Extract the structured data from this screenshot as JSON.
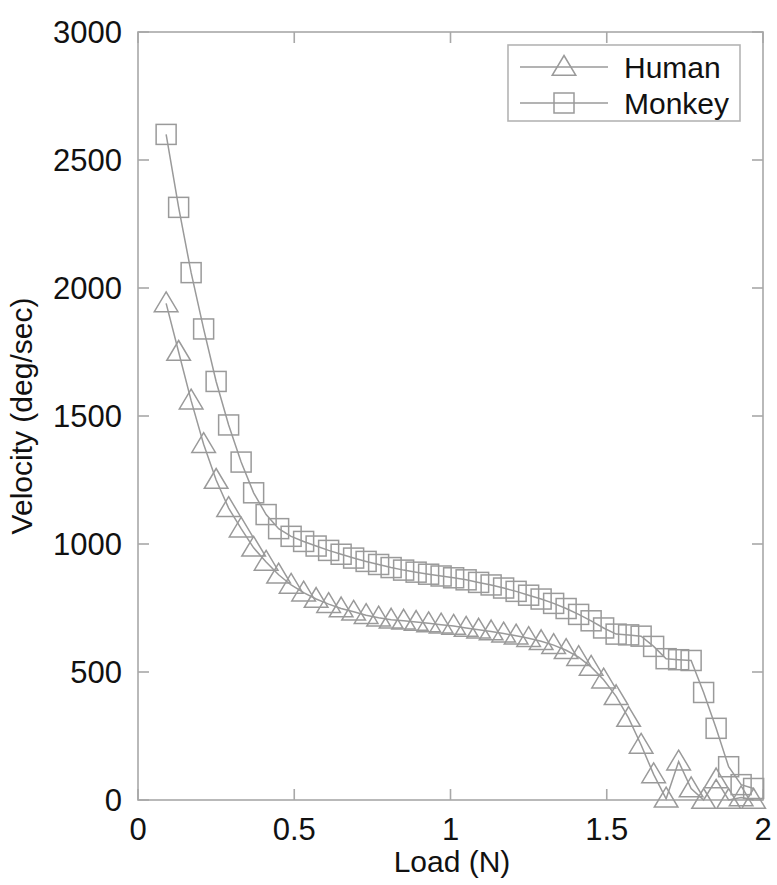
{
  "chart_data": {
    "type": "line",
    "title": "",
    "xlabel": "Load (N)",
    "ylabel": "Velocity (deg/sec)",
    "xlim": [
      0,
      2
    ],
    "ylim": [
      0,
      3000
    ],
    "xticks": [
      "0",
      "0.5",
      "1",
      "1.5",
      "2"
    ],
    "xtick_values": [
      0,
      0.5,
      1,
      1.5,
      2
    ],
    "yticks": [
      "0",
      "500",
      "1000",
      "1500",
      "2000",
      "2500",
      "3000"
    ],
    "ytick_values": [
      0,
      500,
      1000,
      1500,
      2000,
      2500,
      3000
    ],
    "grid": false,
    "legend_position": "top-right",
    "series": [
      {
        "name": "Human",
        "marker": "triangle",
        "x": [
          0.09,
          0.13,
          0.17,
          0.21,
          0.25,
          0.29,
          0.33,
          0.37,
          0.41,
          0.45,
          0.49,
          0.53,
          0.57,
          0.61,
          0.65,
          0.69,
          0.73,
          0.77,
          0.81,
          0.85,
          0.89,
          0.93,
          0.97,
          1.01,
          1.05,
          1.09,
          1.13,
          1.17,
          1.21,
          1.25,
          1.29,
          1.33,
          1.37,
          1.41,
          1.45,
          1.49,
          1.53,
          1.57,
          1.61,
          1.65,
          1.69,
          1.73,
          1.77,
          1.81,
          1.85,
          1.89,
          1.93,
          1.97
        ],
        "y": [
          1940,
          1750,
          1560,
          1390,
          1250,
          1140,
          1060,
          985,
          930,
          880,
          840,
          810,
          785,
          765,
          748,
          735,
          722,
          712,
          704,
          700,
          695,
          690,
          685,
          680,
          672,
          665,
          658,
          650,
          642,
          632,
          620,
          605,
          585,
          558,
          520,
          470,
          405,
          320,
          215,
          100,
          5,
          150,
          45,
          0,
          80,
          0,
          10,
          0
        ]
      },
      {
        "name": "Monkey",
        "marker": "square",
        "x": [
          0.09,
          0.13,
          0.17,
          0.21,
          0.25,
          0.29,
          0.33,
          0.37,
          0.41,
          0.45,
          0.49,
          0.53,
          0.57,
          0.61,
          0.65,
          0.69,
          0.73,
          0.77,
          0.81,
          0.85,
          0.89,
          0.93,
          0.97,
          1.01,
          1.05,
          1.09,
          1.13,
          1.17,
          1.21,
          1.25,
          1.29,
          1.33,
          1.37,
          1.41,
          1.45,
          1.49,
          1.53,
          1.57,
          1.61,
          1.65,
          1.69,
          1.73,
          1.77,
          1.81,
          1.85,
          1.89,
          1.93,
          1.97
        ],
        "y": [
          2600,
          2315,
          2060,
          1840,
          1635,
          1465,
          1320,
          1200,
          1115,
          1060,
          1030,
          1010,
          992,
          975,
          960,
          945,
          932,
          920,
          908,
          898,
          890,
          882,
          875,
          868,
          860,
          850,
          840,
          828,
          815,
          800,
          785,
          768,
          748,
          725,
          700,
          672,
          648,
          645,
          640,
          600,
          552,
          548,
          545,
          420,
          280,
          130,
          60,
          45
        ]
      }
    ]
  },
  "legend": {
    "entries": [
      {
        "label": "Human",
        "marker": "triangle"
      },
      {
        "label": "Monkey",
        "marker": "square"
      }
    ]
  }
}
